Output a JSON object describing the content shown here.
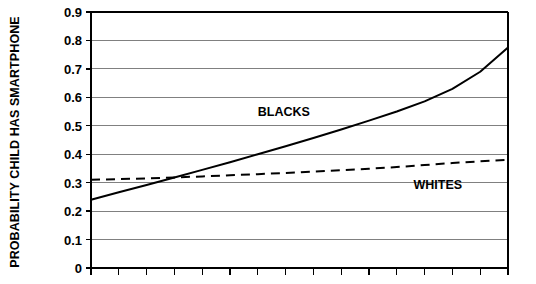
{
  "chart_data": {
    "type": "line",
    "title": "",
    "xlabel": "",
    "ylabel": "PROBABILITY CHILD HAS SMARTPHONE",
    "ylim": [
      0,
      0.9
    ],
    "yticks": [
      "0",
      "0.1",
      "0.2",
      "0.3",
      "0.4",
      "0.5",
      "0.6",
      "0.7",
      "0.8",
      "0.9"
    ],
    "ytick_values": [
      0,
      0.1,
      0.2,
      0.3,
      0.4,
      0.5,
      0.6,
      0.7,
      0.8,
      0.9
    ],
    "xlim": [
      0,
      15
    ],
    "xticks": [
      "",
      "",
      "",
      "",
      "",
      "",
      "",
      "",
      "",
      "",
      "",
      "",
      "",
      "",
      "",
      ""
    ],
    "xtick_count": 16,
    "grid": true,
    "grid_axis": "y",
    "legend_position": "inline-annotation",
    "series": [
      {
        "name": "BLACKS",
        "style": "solid",
        "color": "#000000",
        "x": [
          0,
          1,
          2,
          3,
          4,
          5,
          6,
          7,
          8,
          9,
          10,
          11,
          12,
          13,
          14,
          15
        ],
        "values": [
          0.24,
          0.266,
          0.292,
          0.318,
          0.345,
          0.372,
          0.4,
          0.428,
          0.457,
          0.487,
          0.518,
          0.55,
          0.586,
          0.63,
          0.69,
          0.775
        ],
        "label_x": 6.0,
        "label_y": 0.545
      },
      {
        "name": "WHITES",
        "style": "dashed",
        "color": "#000000",
        "x": [
          0,
          1,
          2,
          3,
          4,
          5,
          6,
          7,
          8,
          9,
          10,
          11,
          12,
          13,
          14,
          15
        ],
        "values": [
          0.31,
          0.3125,
          0.315,
          0.3185,
          0.322,
          0.326,
          0.33,
          0.334,
          0.339,
          0.344,
          0.349,
          0.355,
          0.362,
          0.369,
          0.375,
          0.38
        ],
        "label_x": 11.6,
        "label_y": 0.29
      }
    ],
    "crossing_point": {
      "x": 2.85,
      "y": 0.318
    },
    "colors": {
      "axis": "#000000",
      "grid": "#808080",
      "line": "#000000",
      "background": "#ffffff"
    }
  }
}
